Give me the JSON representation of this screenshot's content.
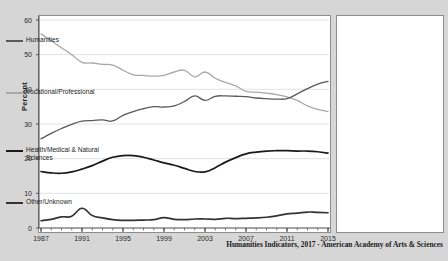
{
  "figure": {
    "background_color": "#d6d6d6",
    "plot_background": "#ffffff",
    "caption": "Humanities Indicators, 2017 · American Academy of Arts & Sciences",
    "axis_title_y": "Percent"
  },
  "legend": {
    "position": "right-panel",
    "items": [
      {
        "label": "Humanities",
        "color": "#595959"
      },
      {
        "label": "Vocational/Professional",
        "color": "#a8a8a8"
      },
      {
        "label": "Health/Medical & Natural Sciences",
        "color": "#1a1a1a"
      },
      {
        "label": "Other/Unknown",
        "color": "#333333"
      }
    ]
  },
  "chart_data": {
    "type": "line",
    "title": "",
    "xlabel": "",
    "ylabel": "Percent",
    "xlim": [
      1987,
      2015
    ],
    "ylim": [
      0,
      60
    ],
    "grid": true,
    "ytick_labels": [
      "0",
      "10",
      "20",
      "30",
      "40",
      "50",
      "60"
    ],
    "yticks": [
      0,
      10,
      20,
      30,
      40,
      50,
      60
    ],
    "xtick_labels": [
      "1987",
      "1991",
      "1995",
      "1999",
      "2003",
      "2007",
      "2011",
      "2015"
    ],
    "xticks": [
      1987,
      1991,
      1995,
      1999,
      2003,
      2007,
      2011,
      2015
    ],
    "x": [
      1987,
      1988,
      1989,
      1990,
      1991,
      1992,
      1993,
      1994,
      1995,
      1996,
      1997,
      1998,
      1999,
      2000,
      2001,
      2002,
      2003,
      2004,
      2005,
      2006,
      2007,
      2008,
      2009,
      2010,
      2011,
      2012,
      2013,
      2014,
      2015
    ],
    "series": [
      {
        "name": "Vocational/Professional",
        "color": "#a8a8a8",
        "values": [
          56.0,
          54.0,
          52.0,
          50.0,
          47.8,
          47.6,
          47.2,
          47.0,
          45.5,
          44.2,
          44.0,
          43.8,
          44.0,
          45.0,
          45.5,
          43.6,
          45.0,
          43.2,
          42.0,
          41.0,
          39.4,
          39.2,
          38.9,
          38.5,
          37.8,
          36.8,
          35.2,
          34.2,
          33.6
        ]
      },
      {
        "name": "Humanities",
        "color": "#595959",
        "values": [
          25.7,
          27.3,
          28.7,
          29.9,
          30.8,
          31.0,
          31.2,
          30.9,
          32.5,
          33.6,
          34.4,
          35.0,
          34.9,
          35.2,
          36.5,
          38.1,
          36.8,
          38.0,
          38.1,
          38.0,
          37.9,
          37.5,
          37.3,
          37.2,
          37.3,
          38.7,
          40.2,
          41.5,
          42.3
        ]
      },
      {
        "name": "Health/Medical & Natural Sciences",
        "color": "#1a1a1a",
        "values": [
          16.3,
          15.9,
          15.8,
          16.2,
          17.0,
          18.0,
          19.3,
          20.4,
          20.9,
          20.9,
          20.4,
          19.6,
          18.8,
          18.1,
          17.2,
          16.3,
          16.2,
          17.4,
          19.0,
          20.3,
          21.4,
          21.9,
          22.2,
          22.3,
          22.3,
          22.2,
          22.2,
          22.0,
          21.6
        ]
      },
      {
        "name": "Other/Unknown",
        "color": "#333333",
        "values": [
          2.1,
          2.5,
          3.2,
          3.4,
          5.7,
          3.6,
          2.9,
          2.4,
          2.2,
          2.2,
          2.3,
          2.4,
          3.0,
          2.5,
          2.4,
          2.6,
          2.6,
          2.5,
          2.8,
          2.7,
          2.8,
          2.9,
          3.1,
          3.5,
          4.1,
          4.3,
          4.6,
          4.5,
          4.4
        ]
      }
    ]
  }
}
